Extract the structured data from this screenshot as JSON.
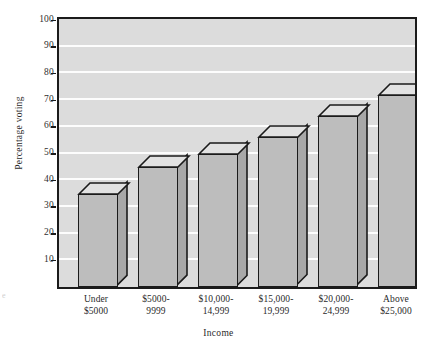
{
  "chart_data": {
    "type": "bar",
    "title": "",
    "xlabel": "Income",
    "ylabel": "Percentage voting",
    "categories": [
      "Under $5000",
      "$5000-9999",
      "$10,000-14,999",
      "$15,000-19,999",
      "$20,000-24,999",
      "Above $25,000"
    ],
    "category_lines": [
      [
        "Under",
        "$5000"
      ],
      [
        "$5000-",
        "9999"
      ],
      [
        "$10,000-",
        "14,999"
      ],
      [
        "$15,000-",
        "19,999"
      ],
      [
        "$20,000-",
        "24,999"
      ],
      [
        "Above",
        "$25,000"
      ]
    ],
    "values": [
      35,
      45,
      50,
      56,
      64,
      72
    ],
    "ylim": [
      0,
      100
    ],
    "ytick_labels": [
      "100",
      "90",
      "80",
      "70",
      "60",
      "50",
      "40",
      "30",
      "20",
      "10"
    ],
    "ytick_values": [
      100,
      90,
      80,
      70,
      60,
      50,
      40,
      30,
      20,
      10
    ],
    "ytick_step": 10,
    "grid": "horizontal-white",
    "legend": "none",
    "style": "3d-rectangular-bars",
    "colors": {
      "bar_front": "#bdbdbd",
      "bar_top": "#e2e2e2",
      "bar_side": "#a8a8a8",
      "plot_background": "#dcdcdc",
      "gridline": "#fdfdfd",
      "axis": "#1b1b1b",
      "text": "#2a2a2a"
    }
  },
  "artifact": {
    "left_edge_text": "e"
  }
}
